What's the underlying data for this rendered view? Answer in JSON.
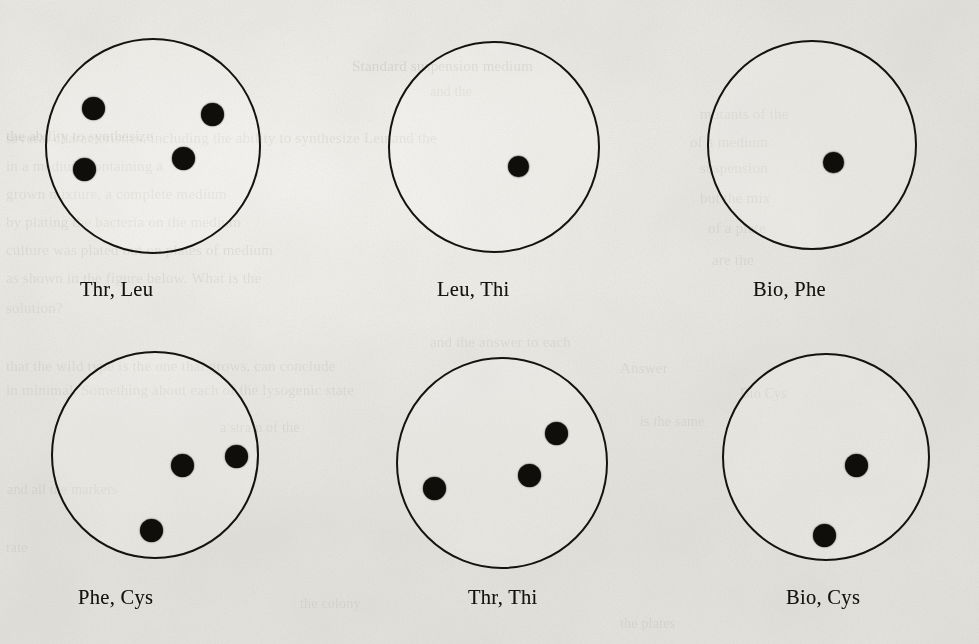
{
  "figure": {
    "kind": "petri-plate-array",
    "background_color": "#efeeea",
    "ink_color": "#15130f",
    "rows": 2,
    "columns": 3,
    "plates": [
      {
        "id": "plate-1",
        "label": "Thr, Leu",
        "supplements": [
          "Thr",
          "Leu"
        ],
        "colony_count": 4,
        "dish": {
          "cx": 153,
          "cy": 146,
          "r": 108
        },
        "label_pos": {
          "x": 80,
          "y": 278
        },
        "colonies": [
          {
            "cx": 93,
            "cy": 108,
            "r": 11.5
          },
          {
            "cx": 212,
            "cy": 114,
            "r": 11.5
          },
          {
            "cx": 84,
            "cy": 169,
            "r": 11.5
          },
          {
            "cx": 183,
            "cy": 158,
            "r": 11.5
          }
        ]
      },
      {
        "id": "plate-2",
        "label": "Leu, Thi",
        "supplements": [
          "Leu",
          "Thi"
        ],
        "colony_count": 1,
        "dish": {
          "cx": 494,
          "cy": 147,
          "r": 106
        },
        "label_pos": {
          "x": 437,
          "y": 278
        },
        "colonies": [
          {
            "cx": 518,
            "cy": 166,
            "r": 10.5
          }
        ]
      },
      {
        "id": "plate-3",
        "label": "Bio, Phe",
        "supplements": [
          "Bio",
          "Phe"
        ],
        "colony_count": 1,
        "dish": {
          "cx": 812,
          "cy": 145,
          "r": 105
        },
        "label_pos": {
          "x": 753,
          "y": 278
        },
        "colonies": [
          {
            "cx": 833,
            "cy": 162,
            "r": 10.5
          }
        ]
      },
      {
        "id": "plate-4",
        "label": "Phe, Cys",
        "supplements": [
          "Phe",
          "Cys"
        ],
        "colony_count": 3,
        "dish": {
          "cx": 155,
          "cy": 455,
          "r": 104
        },
        "label_pos": {
          "x": 78,
          "y": 586
        },
        "colonies": [
          {
            "cx": 182,
            "cy": 465,
            "r": 11.5
          },
          {
            "cx": 236,
            "cy": 456,
            "r": 11.5
          },
          {
            "cx": 151,
            "cy": 530,
            "r": 11.5
          }
        ]
      },
      {
        "id": "plate-5",
        "label": "Thr, Thi",
        "supplements": [
          "Thr",
          "Thi"
        ],
        "colony_count": 3,
        "dish": {
          "cx": 502,
          "cy": 463,
          "r": 106
        },
        "label_pos": {
          "x": 468,
          "y": 586
        },
        "colonies": [
          {
            "cx": 556,
            "cy": 433,
            "r": 11.5
          },
          {
            "cx": 529,
            "cy": 475,
            "r": 11.5
          },
          {
            "cx": 434,
            "cy": 488,
            "r": 11.5
          }
        ]
      },
      {
        "id": "plate-6",
        "label": "Bio, Cys",
        "supplements": [
          "Bio",
          "Cys"
        ],
        "colony_count": 2,
        "dish": {
          "cx": 826,
          "cy": 457,
          "r": 104
        },
        "label_pos": {
          "x": 786,
          "y": 586
        },
        "colonies": [
          {
            "cx": 856,
            "cy": 465,
            "r": 11.5
          },
          {
            "cx": 824,
            "cy": 535,
            "r": 11.5
          }
        ]
      }
    ]
  },
  "background_bleed_text": {
    "note": "faint show-through text from the reverse side of the scanned page",
    "lines": [
      {
        "text": "Standard suspension medium",
        "x": 352,
        "y": 58,
        "size": 15,
        "mirrored": false,
        "weight": "light"
      },
      {
        "text": "and the",
        "x": 430,
        "y": 84,
        "size": 14,
        "mirrored": false,
        "weight": "lighter"
      },
      {
        "text": "the ability to synthesize",
        "x": 6,
        "y": 128,
        "size": 15,
        "mirrored": false,
        "weight": "light"
      },
      {
        "text": "several characteristics, including the ability to synthesize Leu and the",
        "x": 6,
        "y": 130,
        "size": 15,
        "mirrored": false,
        "weight": "lighter"
      },
      {
        "text": "in a medium containing a",
        "x": 6,
        "y": 158,
        "size": 15,
        "mirrored": false,
        "weight": "lighter"
      },
      {
        "text": "grown mixture, a complete medium",
        "x": 6,
        "y": 186,
        "size": 15,
        "mirrored": false,
        "weight": "lighter"
      },
      {
        "text": "by plating the bacteria on the medium",
        "x": 6,
        "y": 214,
        "size": 15,
        "mirrored": false,
        "weight": "lighter"
      },
      {
        "text": "culture was plated out on plates of medium",
        "x": 6,
        "y": 242,
        "size": 15,
        "mirrored": false,
        "weight": "lighter"
      },
      {
        "text": "as shown in the figure below. What is the",
        "x": 6,
        "y": 270,
        "size": 15,
        "mirrored": false,
        "weight": "lighter"
      },
      {
        "text": "solution?",
        "x": 6,
        "y": 300,
        "size": 15,
        "mirrored": false,
        "weight": "lighter"
      },
      {
        "text": "that the wild type is the one that grows, can conclude",
        "x": 6,
        "y": 358,
        "size": 15,
        "mirrored": false,
        "weight": "lighter"
      },
      {
        "text": "in minimal. Something about each of the lysogenic state",
        "x": 6,
        "y": 382,
        "size": 15,
        "mirrored": false,
        "weight": "lighter"
      },
      {
        "text": "and all the markers",
        "x": 7,
        "y": 482,
        "size": 14,
        "mirrored": false,
        "weight": "lighter"
      },
      {
        "text": "rate",
        "x": 6,
        "y": 540,
        "size": 14,
        "mirrored": false,
        "weight": "lighter"
      },
      {
        "text": "mutants of the",
        "x": 700,
        "y": 106,
        "size": 15,
        "mirrored": false,
        "weight": "lighter"
      },
      {
        "text": "of a medium",
        "x": 690,
        "y": 134,
        "size": 15,
        "mirrored": false,
        "weight": "lighter"
      },
      {
        "text": "suspension",
        "x": 700,
        "y": 160,
        "size": 15,
        "mirrored": false,
        "weight": "lighter"
      },
      {
        "text": "but the mix",
        "x": 700,
        "y": 190,
        "size": 15,
        "mirrored": false,
        "weight": "lighter"
      },
      {
        "text": "of a plate",
        "x": 708,
        "y": 220,
        "size": 15,
        "mirrored": false,
        "weight": "lighter"
      },
      {
        "text": "are the",
        "x": 712,
        "y": 252,
        "size": 15,
        "mirrored": false,
        "weight": "lighter"
      },
      {
        "text": "and the answer to each",
        "x": 430,
        "y": 334,
        "size": 15,
        "mirrored": false,
        "weight": "lighter"
      },
      {
        "text": "Answer",
        "x": 620,
        "y": 360,
        "size": 15,
        "mirrored": false,
        "weight": "lighter"
      },
      {
        "text": "Bio Cys",
        "x": 740,
        "y": 386,
        "size": 14,
        "mirrored": false,
        "weight": "lighter"
      },
      {
        "text": "is the same",
        "x": 640,
        "y": 414,
        "size": 14,
        "mirrored": false,
        "weight": "lighter"
      },
      {
        "text": "a strain of the",
        "x": 220,
        "y": 420,
        "size": 14,
        "mirrored": false,
        "weight": "lighter"
      },
      {
        "text": "the colony",
        "x": 300,
        "y": 596,
        "size": 14,
        "mirrored": false,
        "weight": "lighter"
      },
      {
        "text": "the plates",
        "x": 620,
        "y": 616,
        "size": 14,
        "mirrored": false,
        "weight": "lighter"
      }
    ]
  }
}
